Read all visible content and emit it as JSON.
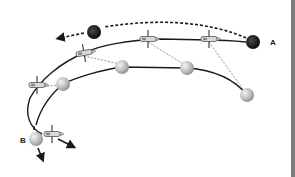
{
  "diagram": {
    "type": "orbital-trajectory",
    "labels": {
      "point_a": "A",
      "point_b": "B"
    },
    "colors": {
      "background": "#ffffff",
      "line": "#1a1a1a",
      "dark_body": "#1c1c1c",
      "light_body": "#c8c8c8",
      "connector": "#777777",
      "edge_bar": "#7a7a7a"
    },
    "paths": [
      {
        "name": "dark-body-trajectory",
        "style": "dashed",
        "from": "A",
        "direction": "leftward",
        "arrow": true
      },
      {
        "name": "satellite-orbit",
        "style": "solid"
      },
      {
        "name": "light-body-orbit",
        "style": "solid",
        "to": "B"
      }
    ],
    "dark_bodies": [
      {
        "name": "dark-body-a",
        "x": 253,
        "y": 42,
        "r": 7
      },
      {
        "name": "dark-body-top",
        "x": 94,
        "y": 32,
        "r": 7
      }
    ],
    "light_bodies": [
      {
        "name": "light-body-1",
        "x": 247,
        "y": 95,
        "r": 7
      },
      {
        "name": "light-body-2",
        "x": 187,
        "y": 68,
        "r": 7
      },
      {
        "name": "light-body-3",
        "x": 122,
        "y": 67,
        "r": 7
      },
      {
        "name": "light-body-4",
        "x": 63,
        "y": 84,
        "r": 7
      },
      {
        "name": "light-body-b",
        "x": 36,
        "y": 139,
        "r": 7
      }
    ],
    "satellites": [
      {
        "name": "satellite-1",
        "x": 209,
        "y": 39
      },
      {
        "name": "satellite-2",
        "x": 148,
        "y": 39
      },
      {
        "name": "satellite-3",
        "x": 84,
        "y": 53
      },
      {
        "name": "satellite-4",
        "x": 37,
        "y": 85
      },
      {
        "name": "satellite-5",
        "x": 52,
        "y": 134
      }
    ]
  }
}
